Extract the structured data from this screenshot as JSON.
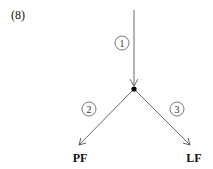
{
  "diagram": {
    "number": "(8)",
    "edges": [
      {
        "id": "1",
        "label": "1"
      },
      {
        "id": "2",
        "label": "2"
      },
      {
        "id": "3",
        "label": "3"
      }
    ],
    "nodes": {
      "left": "PF",
      "right": "LF"
    },
    "colors": {
      "line": "#555555",
      "dot": "#000000",
      "text": "#111111"
    }
  }
}
